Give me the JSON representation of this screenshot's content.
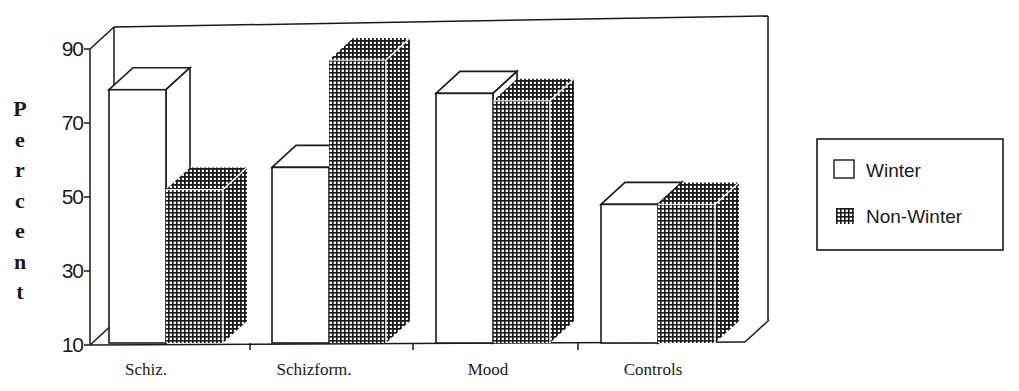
{
  "chart_data": {
    "type": "bar",
    "style": "3d-clustered",
    "title": "",
    "xlabel": "",
    "ylabel": "Percent",
    "ylim": [
      10,
      90
    ],
    "yticks": [
      10,
      30,
      50,
      70,
      90
    ],
    "grid": false,
    "legend_position": "right",
    "categories": [
      "Schiz.",
      "Schizform.",
      "Mood",
      "Controls"
    ],
    "series": [
      {
        "name": "Winter",
        "pattern": "white",
        "values": [
          79,
          58,
          78,
          48
        ]
      },
      {
        "name": "Non-Winter",
        "pattern": "crosshatch",
        "values": [
          52,
          87,
          76,
          48
        ]
      }
    ]
  },
  "axis": {
    "ylabel_letters": [
      "P",
      "e",
      "r",
      "c",
      "e",
      "n",
      "t"
    ],
    "ytick_labels": [
      "90",
      "70",
      "50",
      "30",
      "10"
    ]
  },
  "legend": {
    "items": [
      {
        "label": "Winter"
      },
      {
        "label": "Non-Winter"
      }
    ]
  },
  "colors": {
    "ink": "#1a1a1a",
    "background": "#ffffff"
  }
}
